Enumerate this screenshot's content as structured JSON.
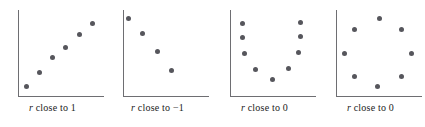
{
  "figure": {
    "dot_color": "#56565c",
    "axis_color": "#6e6e72",
    "background_color": "#ffffff"
  },
  "chart_data": [
    {
      "type": "scatter",
      "title": "r close to 1",
      "caption_variable": "r",
      "caption_rest": " close to 1",
      "r_value": 1,
      "pattern": "strong positive linear",
      "xlabel": "",
      "ylabel": "",
      "xlim": [
        0,
        100
      ],
      "ylim": [
        0,
        100
      ],
      "grid": false,
      "axes": "left and bottom spines only",
      "points": [
        {
          "x": 10,
          "y": 12
        },
        {
          "x": 25,
          "y": 28
        },
        {
          "x": 40,
          "y": 45
        },
        {
          "x": 55,
          "y": 57
        },
        {
          "x": 72,
          "y": 72
        },
        {
          "x": 87,
          "y": 85
        }
      ]
    },
    {
      "type": "scatter",
      "title": "r close to -1",
      "caption_variable": "r",
      "caption_rest": " close to −1",
      "r_value": -1,
      "pattern": "strong negative linear",
      "xlabel": "",
      "ylabel": "",
      "xlim": [
        0,
        100
      ],
      "ylim": [
        0,
        100
      ],
      "grid": false,
      "axes": "left and bottom spines only",
      "points": [
        {
          "x": 6,
          "y": 90
        },
        {
          "x": 23,
          "y": 73
        },
        {
          "x": 40,
          "y": 52
        },
        {
          "x": 56,
          "y": 30
        }
      ]
    },
    {
      "type": "scatter",
      "title": "r close to 0 (curved)",
      "caption_variable": "r",
      "caption_rest": " close to 0",
      "r_value": 0,
      "pattern": "U-shaped curvilinear",
      "xlabel": "",
      "ylabel": "",
      "xlim": [
        0,
        100
      ],
      "ylim": [
        0,
        100
      ],
      "grid": false,
      "axes": "left and bottom spines only",
      "points": [
        {
          "x": 14,
          "y": 85
        },
        {
          "x": 14,
          "y": 68
        },
        {
          "x": 17,
          "y": 50
        },
        {
          "x": 30,
          "y": 32
        },
        {
          "x": 49,
          "y": 20
        },
        {
          "x": 68,
          "y": 33
        },
        {
          "x": 80,
          "y": 51
        },
        {
          "x": 82,
          "y": 69
        },
        {
          "x": 82,
          "y": 86
        }
      ]
    },
    {
      "type": "scatter",
      "title": "r close to 0 (circular)",
      "caption_variable": "r",
      "caption_rest": " close to 0",
      "r_value": 0,
      "pattern": "circular / no association",
      "xlabel": "",
      "ylabel": "",
      "xlim": [
        0,
        100
      ],
      "ylim": [
        0,
        100
      ],
      "grid": false,
      "axes": "left and bottom spines only",
      "points": [
        {
          "x": 50,
          "y": 90
        },
        {
          "x": 22,
          "y": 78
        },
        {
          "x": 76,
          "y": 78
        },
        {
          "x": 10,
          "y": 50
        },
        {
          "x": 88,
          "y": 50
        },
        {
          "x": 22,
          "y": 24
        },
        {
          "x": 76,
          "y": 24
        },
        {
          "x": 48,
          "y": 12
        }
      ]
    }
  ]
}
